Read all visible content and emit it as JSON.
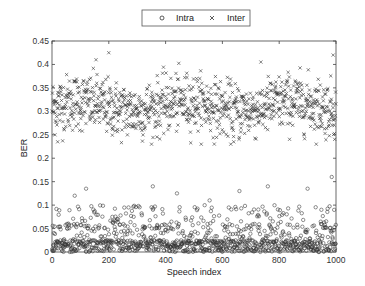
{
  "chart_data": {
    "type": "scatter",
    "title": "",
    "xlabel": "Speech index",
    "ylabel": "BER",
    "xlim": [
      0,
      1000
    ],
    "ylim": [
      0,
      0.45
    ],
    "xticks": [
      0,
      200,
      400,
      600,
      800,
      1000
    ],
    "xtick_labels": [
      "0",
      "200",
      "400",
      "600",
      "800",
      "1000"
    ],
    "yticks": [
      0,
      0.05,
      0.1,
      0.15,
      0.2,
      0.25,
      0.3,
      0.35,
      0.4,
      0.45
    ],
    "ytick_labels": [
      "0",
      "0.05",
      "0.1",
      "0.15",
      "0.2",
      "0.25",
      "0.3",
      "0.35",
      "0.4",
      "0.45"
    ],
    "grid": false,
    "legend_position": "top-center-outside",
    "series": [
      {
        "name": "Intra",
        "marker": "circle",
        "color": "#333333",
        "n_points": 1000,
        "distribution": {
          "description": "Dense near 0 (mostly 0-0.03), sparser spread up to ~0.1, few outliers up to ~0.16",
          "median": 0.015,
          "typical_max": 0.1,
          "outliers": [
            {
              "x": 120,
              "y": 0.135
            },
            {
              "x": 80,
              "y": 0.12
            },
            {
              "x": 355,
              "y": 0.14
            },
            {
              "x": 440,
              "y": 0.125
            },
            {
              "x": 555,
              "y": 0.11
            },
            {
              "x": 660,
              "y": 0.13
            },
            {
              "x": 760,
              "y": 0.14
            },
            {
              "x": 900,
              "y": 0.135
            },
            {
              "x": 985,
              "y": 0.16
            }
          ]
        }
      },
      {
        "name": "Inter",
        "marker": "x",
        "color": "#333333",
        "n_points": 1000,
        "distribution": {
          "description": "Band centered around ~0.31, mostly between 0.26 and 0.37, range ~0.23-0.42",
          "mean": 0.31,
          "std": 0.03,
          "min": 0.23,
          "max": 0.42,
          "outliers": [
            {
              "x": 200,
              "y": 0.425
            },
            {
              "x": 155,
              "y": 0.41
            },
            {
              "x": 20,
              "y": 0.235
            },
            {
              "x": 640,
              "y": 0.235
            },
            {
              "x": 990,
              "y": 0.42
            }
          ]
        }
      }
    ]
  },
  "legend": {
    "items": [
      {
        "label": "Intra",
        "marker": "circle"
      },
      {
        "label": "Inter",
        "marker": "x"
      }
    ]
  },
  "axes": {
    "xlabel": "Speech index",
    "ylabel": "BER"
  }
}
